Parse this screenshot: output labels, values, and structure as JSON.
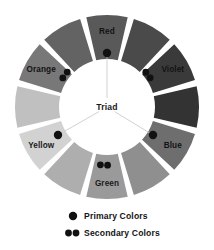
{
  "diagram": {
    "title_center": "Triad",
    "geometry": {
      "center_x": 107,
      "center_y": 107,
      "outer_radius": 92,
      "inner_radius": 48,
      "segment_count": 12,
      "gap_degrees": 4
    },
    "segments": [
      {
        "index": 0,
        "name": "Red",
        "label": "Red",
        "labeled": true,
        "role": "primary",
        "color": "#595959",
        "angle_center_deg": -90,
        "label_radius": 76,
        "label_dark_text": false
      },
      {
        "index": 1,
        "name": "Red-Violet",
        "label": "",
        "labeled": false,
        "role": "tertiary",
        "color": "#4a4a4a",
        "angle_center_deg": -60,
        "label_radius": 76,
        "label_dark_text": false
      },
      {
        "index": 2,
        "name": "Violet",
        "label": "Violet",
        "labeled": true,
        "role": "secondary",
        "color": "#3a3a3a",
        "angle_center_deg": -30,
        "label_radius": 76,
        "label_dark_text": false
      },
      {
        "index": 3,
        "name": "Blue-Violet",
        "label": "",
        "labeled": false,
        "role": "tertiary",
        "color": "#333333",
        "angle_center_deg": 0,
        "label_radius": 76,
        "label_dark_text": false
      },
      {
        "index": 4,
        "name": "Blue",
        "label": "Blue",
        "labeled": true,
        "role": "primary",
        "color": "#6e6e6e",
        "angle_center_deg": 30,
        "label_radius": 76,
        "label_dark_text": false
      },
      {
        "index": 5,
        "name": "Blue-Green",
        "label": "",
        "labeled": false,
        "role": "tertiary",
        "color": "#8f8f8f",
        "angle_center_deg": 60,
        "label_radius": 76,
        "label_dark_text": false
      },
      {
        "index": 6,
        "name": "Green",
        "label": "Green",
        "labeled": true,
        "role": "secondary",
        "color": "#9a9a9a",
        "angle_center_deg": 90,
        "label_radius": 76,
        "label_dark_text": true
      },
      {
        "index": 7,
        "name": "Yellow-Green",
        "label": "",
        "labeled": false,
        "role": "tertiary",
        "color": "#aeaeae",
        "angle_center_deg": 120,
        "label_radius": 76,
        "label_dark_text": true
      },
      {
        "index": 8,
        "name": "Yellow",
        "label": "Yellow",
        "labeled": true,
        "role": "primary",
        "color": "#d2d2d2",
        "angle_center_deg": 150,
        "label_radius": 76,
        "label_dark_text": true
      },
      {
        "index": 9,
        "name": "Yellow-Orange",
        "label": "",
        "labeled": false,
        "role": "tertiary",
        "color": "#c0c0c0",
        "angle_center_deg": 180,
        "label_radius": 76,
        "label_dark_text": true
      },
      {
        "index": 10,
        "name": "Orange",
        "label": "Orange",
        "labeled": true,
        "role": "secondary",
        "color": "#787878",
        "angle_center_deg": 210,
        "label_radius": 76,
        "label_dark_text": false
      },
      {
        "index": 11,
        "name": "Red-Orange",
        "label": "",
        "labeled": false,
        "role": "tertiary",
        "color": "#636363",
        "angle_center_deg": 240,
        "label_radius": 76,
        "label_dark_text": false
      }
    ],
    "markers": [
      {
        "for_segment": "Red",
        "type": "primary",
        "dots": 1,
        "x": 107,
        "y": 53
      },
      {
        "for_segment": "Violet",
        "type": "secondary",
        "dots": 2,
        "x": 148,
        "y": 75
      },
      {
        "for_segment": "Blue",
        "type": "primary",
        "dots": 1,
        "x": 153,
        "y": 135
      },
      {
        "for_segment": "Green",
        "type": "secondary",
        "dots": 2,
        "x": 104,
        "y": 165
      },
      {
        "for_segment": "Yellow",
        "type": "primary",
        "dots": 1,
        "x": 58,
        "y": 135
      },
      {
        "for_segment": "Orange",
        "type": "secondary",
        "dots": 2,
        "x": 65,
        "y": 75
      }
    ],
    "triad_connections": [
      {
        "from": "center",
        "to": "Red"
      },
      {
        "from": "center",
        "to": "Yellow"
      },
      {
        "from": "center",
        "to": "Blue"
      }
    ]
  },
  "legend": {
    "items": [
      {
        "key": "primary",
        "dots": 1,
        "label": "Primary Colors"
      },
      {
        "key": "secondary",
        "dots": 2,
        "label": "Secondary Colors"
      }
    ],
    "dot_color": "#111111"
  },
  "colors": {
    "background": "#ffffff",
    "text": "#141414",
    "triad_line": "#cccccc"
  }
}
